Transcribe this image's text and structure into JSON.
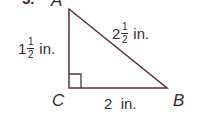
{
  "problem": {
    "number": "5."
  },
  "triangle": {
    "vertices": {
      "A": "A",
      "B": "B",
      "C": "C"
    },
    "right_angle_at": "C",
    "sides": {
      "AC": {
        "whole": "1",
        "num": "1",
        "den": "2",
        "unit": "in."
      },
      "AB": {
        "whole": "2",
        "num": "1",
        "den": "2",
        "unit": "in."
      },
      "CB": {
        "text": "2  in."
      }
    },
    "stroke_color": "#5a3038"
  }
}
